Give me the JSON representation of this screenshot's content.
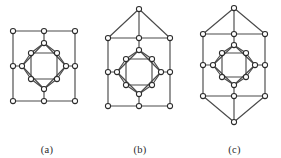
{
  "figure": {
    "background_color": "#ffffff",
    "edge_color": "#4a4a4a",
    "vertex_fill": "#ffffff",
    "vertex_stroke": "#2b2b2b",
    "vertex_radius": 2.6,
    "panel_count": 3
  },
  "panels": [
    {
      "id": "a",
      "caption": "(a)",
      "vertex_count": 16,
      "edge_count": 24,
      "description": "nested squares graph",
      "vertices": [
        {
          "name": "outer-top-left",
          "x": 13,
          "y": 31
        },
        {
          "name": "outer-top-mid",
          "x": 44,
          "y": 31
        },
        {
          "name": "outer-top-right",
          "x": 75,
          "y": 31
        },
        {
          "name": "outer-mid-right",
          "x": 75,
          "y": 66
        },
        {
          "name": "outer-bottom-right",
          "x": 75,
          "y": 101
        },
        {
          "name": "outer-bottom-mid",
          "x": 44,
          "y": 101
        },
        {
          "name": "outer-bottom-left",
          "x": 13,
          "y": 101
        },
        {
          "name": "outer-mid-left",
          "x": 13,
          "y": 66
        },
        {
          "name": "diamond-top",
          "x": 44,
          "y": 43
        },
        {
          "name": "diamond-right",
          "x": 66,
          "y": 66
        },
        {
          "name": "diamond-bottom",
          "x": 44,
          "y": 89
        },
        {
          "name": "diamond-left",
          "x": 22,
          "y": 66
        },
        {
          "name": "inner-top-left",
          "x": 31,
          "y": 53
        },
        {
          "name": "inner-top-right",
          "x": 57,
          "y": 53
        },
        {
          "name": "inner-bottom-right",
          "x": 57,
          "y": 79
        },
        {
          "name": "inner-bottom-left",
          "x": 31,
          "y": 79
        }
      ],
      "edges": [
        [
          "outer-top-left",
          "outer-top-mid"
        ],
        [
          "outer-top-mid",
          "outer-top-right"
        ],
        [
          "outer-top-right",
          "outer-mid-right"
        ],
        [
          "outer-mid-right",
          "outer-bottom-right"
        ],
        [
          "outer-bottom-right",
          "outer-bottom-mid"
        ],
        [
          "outer-bottom-mid",
          "outer-bottom-left"
        ],
        [
          "outer-bottom-left",
          "outer-mid-left"
        ],
        [
          "outer-mid-left",
          "outer-top-left"
        ],
        [
          "outer-top-mid",
          "diamond-top"
        ],
        [
          "outer-mid-right",
          "diamond-right"
        ],
        [
          "outer-bottom-mid",
          "diamond-bottom"
        ],
        [
          "outer-mid-left",
          "diamond-left"
        ],
        [
          "diamond-top",
          "diamond-right"
        ],
        [
          "diamond-right",
          "diamond-bottom"
        ],
        [
          "diamond-bottom",
          "diamond-left"
        ],
        [
          "diamond-left",
          "diamond-top"
        ],
        [
          "diamond-top",
          "inner-top-left"
        ],
        [
          "diamond-top",
          "inner-top-right"
        ],
        [
          "diamond-right",
          "inner-top-right"
        ],
        [
          "diamond-right",
          "inner-bottom-right"
        ],
        [
          "diamond-bottom",
          "inner-bottom-right"
        ],
        [
          "diamond-bottom",
          "inner-bottom-left"
        ],
        [
          "diamond-left",
          "inner-bottom-left"
        ],
        [
          "diamond-left",
          "inner-top-left"
        ],
        [
          "inner-top-left",
          "inner-top-right"
        ],
        [
          "inner-top-right",
          "inner-bottom-right"
        ],
        [
          "inner-bottom-right",
          "inner-bottom-left"
        ],
        [
          "inner-bottom-left",
          "inner-top-left"
        ]
      ]
    },
    {
      "id": "b",
      "caption": "(b)",
      "vertex_count": 17,
      "description": "nested squares graph with top apex vertex",
      "vertices": [
        {
          "name": "apex-top",
          "x": 47,
          "y": 9
        },
        {
          "name": "outer-top-left",
          "x": 16,
          "y": 38
        },
        {
          "name": "outer-top-mid",
          "x": 47,
          "y": 38
        },
        {
          "name": "outer-top-right",
          "x": 78,
          "y": 38
        },
        {
          "name": "outer-mid-right",
          "x": 78,
          "y": 72
        },
        {
          "name": "outer-bottom-right",
          "x": 78,
          "y": 106
        },
        {
          "name": "outer-bottom-mid",
          "x": 47,
          "y": 106
        },
        {
          "name": "outer-bottom-left",
          "x": 16,
          "y": 106
        },
        {
          "name": "outer-mid-left",
          "x": 16,
          "y": 72
        },
        {
          "name": "diamond-top",
          "x": 47,
          "y": 50
        },
        {
          "name": "diamond-right",
          "x": 69,
          "y": 72
        },
        {
          "name": "diamond-bottom",
          "x": 47,
          "y": 94
        },
        {
          "name": "diamond-left",
          "x": 25,
          "y": 72
        },
        {
          "name": "inner-top-left",
          "x": 34,
          "y": 59
        },
        {
          "name": "inner-top-right",
          "x": 60,
          "y": 59
        },
        {
          "name": "inner-bottom-right",
          "x": 60,
          "y": 85
        },
        {
          "name": "inner-bottom-left",
          "x": 34,
          "y": 85
        }
      ],
      "edges": [
        [
          "apex-top",
          "outer-top-left"
        ],
        [
          "apex-top",
          "outer-top-mid"
        ],
        [
          "apex-top",
          "outer-top-right"
        ],
        [
          "outer-top-left",
          "outer-top-mid"
        ],
        [
          "outer-top-mid",
          "outer-top-right"
        ],
        [
          "outer-top-right",
          "outer-mid-right"
        ],
        [
          "outer-mid-right",
          "outer-bottom-right"
        ],
        [
          "outer-bottom-right",
          "outer-bottom-mid"
        ],
        [
          "outer-bottom-mid",
          "outer-bottom-left"
        ],
        [
          "outer-bottom-left",
          "outer-mid-left"
        ],
        [
          "outer-mid-left",
          "outer-top-left"
        ],
        [
          "outer-top-mid",
          "diamond-top"
        ],
        [
          "outer-mid-right",
          "diamond-right"
        ],
        [
          "outer-bottom-mid",
          "diamond-bottom"
        ],
        [
          "outer-mid-left",
          "diamond-left"
        ],
        [
          "diamond-top",
          "diamond-right"
        ],
        [
          "diamond-right",
          "diamond-bottom"
        ],
        [
          "diamond-bottom",
          "diamond-left"
        ],
        [
          "diamond-left",
          "diamond-top"
        ],
        [
          "diamond-top",
          "inner-top-left"
        ],
        [
          "diamond-top",
          "inner-top-right"
        ],
        [
          "diamond-right",
          "inner-top-right"
        ],
        [
          "diamond-right",
          "inner-bottom-right"
        ],
        [
          "diamond-bottom",
          "inner-bottom-right"
        ],
        [
          "diamond-bottom",
          "inner-bottom-left"
        ],
        [
          "diamond-left",
          "inner-bottom-left"
        ],
        [
          "diamond-left",
          "inner-top-left"
        ],
        [
          "inner-top-left",
          "inner-top-right"
        ],
        [
          "inner-top-right",
          "inner-bottom-right"
        ],
        [
          "inner-bottom-right",
          "inner-bottom-left"
        ],
        [
          "inner-bottom-left",
          "inner-top-left"
        ]
      ]
    },
    {
      "id": "c",
      "caption": "(c)",
      "vertex_count": 18,
      "description": "nested squares graph with top and bottom apex vertices",
      "vertices": [
        {
          "name": "apex-top",
          "x": 46,
          "y": 8
        },
        {
          "name": "outer-top-left",
          "x": 15,
          "y": 34
        },
        {
          "name": "outer-top-mid",
          "x": 46,
          "y": 34
        },
        {
          "name": "outer-top-right",
          "x": 77,
          "y": 34
        },
        {
          "name": "outer-mid-right",
          "x": 77,
          "y": 65
        },
        {
          "name": "outer-bottom-right",
          "x": 77,
          "y": 96
        },
        {
          "name": "outer-bottom-mid",
          "x": 46,
          "y": 96
        },
        {
          "name": "outer-bottom-left",
          "x": 15,
          "y": 96
        },
        {
          "name": "outer-mid-left",
          "x": 15,
          "y": 65
        },
        {
          "name": "apex-bottom",
          "x": 46,
          "y": 122
        },
        {
          "name": "diamond-top",
          "x": 46,
          "y": 45
        },
        {
          "name": "diamond-right",
          "x": 67,
          "y": 65
        },
        {
          "name": "diamond-bottom",
          "x": 46,
          "y": 85
        },
        {
          "name": "diamond-left",
          "x": 25,
          "y": 65
        },
        {
          "name": "inner-top-left",
          "x": 34,
          "y": 53
        },
        {
          "name": "inner-top-right",
          "x": 58,
          "y": 53
        },
        {
          "name": "inner-bottom-right",
          "x": 58,
          "y": 77
        },
        {
          "name": "inner-bottom-left",
          "x": 34,
          "y": 77
        }
      ],
      "edges": [
        [
          "apex-top",
          "outer-top-left"
        ],
        [
          "apex-top",
          "outer-top-mid"
        ],
        [
          "apex-top",
          "outer-top-right"
        ],
        [
          "apex-bottom",
          "outer-bottom-left"
        ],
        [
          "apex-bottom",
          "outer-bottom-mid"
        ],
        [
          "apex-bottom",
          "outer-bottom-right"
        ],
        [
          "outer-top-left",
          "outer-top-mid"
        ],
        [
          "outer-top-mid",
          "outer-top-right"
        ],
        [
          "outer-top-right",
          "outer-mid-right"
        ],
        [
          "outer-mid-right",
          "outer-bottom-right"
        ],
        [
          "outer-bottom-right",
          "outer-bottom-mid"
        ],
        [
          "outer-bottom-mid",
          "outer-bottom-left"
        ],
        [
          "outer-bottom-left",
          "outer-mid-left"
        ],
        [
          "outer-mid-left",
          "outer-top-left"
        ],
        [
          "outer-top-mid",
          "diamond-top"
        ],
        [
          "outer-mid-right",
          "diamond-right"
        ],
        [
          "outer-bottom-mid",
          "diamond-bottom"
        ],
        [
          "outer-mid-left",
          "diamond-left"
        ],
        [
          "diamond-top",
          "diamond-right"
        ],
        [
          "diamond-right",
          "diamond-bottom"
        ],
        [
          "diamond-bottom",
          "diamond-left"
        ],
        [
          "diamond-left",
          "diamond-top"
        ],
        [
          "diamond-top",
          "inner-top-left"
        ],
        [
          "diamond-top",
          "inner-top-right"
        ],
        [
          "diamond-right",
          "inner-top-right"
        ],
        [
          "diamond-right",
          "inner-bottom-right"
        ],
        [
          "diamond-bottom",
          "inner-bottom-right"
        ],
        [
          "diamond-bottom",
          "inner-bottom-left"
        ],
        [
          "diamond-left",
          "inner-bottom-left"
        ],
        [
          "diamond-left",
          "inner-top-left"
        ],
        [
          "inner-top-left",
          "inner-top-right"
        ],
        [
          "inner-top-right",
          "inner-bottom-right"
        ],
        [
          "inner-bottom-right",
          "inner-bottom-left"
        ],
        [
          "inner-bottom-left",
          "inner-top-left"
        ]
      ]
    }
  ]
}
